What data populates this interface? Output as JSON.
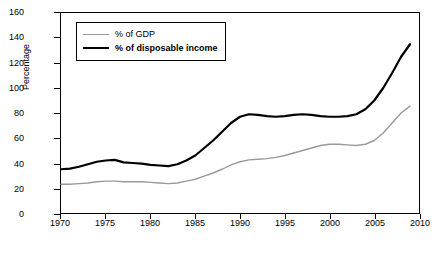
{
  "chart_data": {
    "type": "line",
    "title": "",
    "xlabel": "",
    "ylabel": "Percentage",
    "xlim": [
      1970,
      2010
    ],
    "ylim": [
      0,
      160
    ],
    "grid": false,
    "legend_position": "top-left",
    "x_ticks": [
      1970,
      1975,
      1980,
      1985,
      1990,
      1995,
      2000,
      2005,
      2010
    ],
    "y_ticks": [
      0,
      20,
      40,
      60,
      80,
      100,
      120,
      140,
      160
    ],
    "x": [
      1970,
      1971,
      1972,
      1973,
      1974,
      1975,
      1976,
      1977,
      1978,
      1979,
      1980,
      1981,
      1982,
      1983,
      1984,
      1985,
      1986,
      1987,
      1988,
      1989,
      1990,
      1991,
      1992,
      1993,
      1994,
      1995,
      1996,
      1997,
      1998,
      1999,
      2000,
      2001,
      2002,
      2003,
      2004,
      2005,
      2006,
      2007,
      2008,
      2009
    ],
    "series": [
      {
        "name": "% of GDP",
        "color": "#9a9a9a",
        "width": 1.4,
        "values": [
          23,
          23,
          23.5,
          24,
          25,
          25.5,
          25.5,
          25,
          25,
          25,
          24.5,
          24,
          23.5,
          24,
          25.5,
          27,
          29.5,
          32,
          35,
          38.5,
          41,
          42.5,
          43,
          43.5,
          44.5,
          46,
          48,
          50,
          52,
          54,
          55,
          55,
          54.5,
          54,
          55,
          58,
          64,
          72,
          80,
          85.5
        ]
      },
      {
        "name": "% of disposable income",
        "color": "#000000",
        "width": 2.2,
        "values": [
          35,
          35.5,
          37,
          39,
          41,
          42,
          42.5,
          40.5,
          40,
          39.5,
          38.5,
          38,
          37.5,
          39,
          42,
          46,
          52,
          58,
          65,
          72,
          77,
          79,
          78.5,
          77.5,
          77,
          77.5,
          78.5,
          79,
          78.5,
          77.5,
          77,
          77,
          77.5,
          79,
          83,
          90,
          100,
          112,
          125,
          135
        ]
      }
    ]
  },
  "axes": {
    "y_title": "Percentage"
  },
  "legend": {
    "items": [
      {
        "label": "% of GDP",
        "color": "#9a9a9a",
        "bold": false
      },
      {
        "label": "% of disposable income",
        "color": "#000000",
        "bold": true
      }
    ]
  }
}
